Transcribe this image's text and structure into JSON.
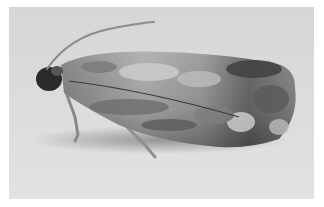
{
  "image": {
    "subject": "moth",
    "description": "Grayscale photograph of a mottled gray-brown moth resting on a pale surface, side view with antenna raised",
    "colors": {
      "background": "#dcdcdc",
      "wing_light": "#c4c4c4",
      "wing_mid": "#8f8f8f",
      "wing_dark": "#4a4a4a",
      "head": "#2a2a2a",
      "border": "#ffffff"
    }
  }
}
